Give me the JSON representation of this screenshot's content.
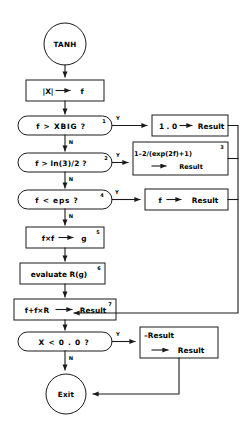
{
  "diagram": {
    "title_node": "TANH",
    "end_node": "Exit",
    "nodes": [
      {
        "id": "start",
        "kind": "terminal",
        "label": "TANH"
      },
      {
        "id": "abs",
        "kind": "process",
        "label": "|X|",
        "arrow": "→",
        "label2": "f"
      },
      {
        "id": "dec_xbig",
        "kind": "decision",
        "label": "f  >  XBIG  ?",
        "note": "1"
      },
      {
        "id": "res_one",
        "kind": "process",
        "label": "1 . 0",
        "arrow": "→",
        "label2": "Result"
      },
      {
        "id": "dec_ln32",
        "kind": "decision",
        "label": "f  >  ln(3)/2  ?",
        "note": "2"
      },
      {
        "id": "res_exp",
        "kind": "process",
        "label": "1–2/(exp(2f)+1)",
        "arrow": "→",
        "label2": "Result",
        "note": "3"
      },
      {
        "id": "dec_eps",
        "kind": "decision",
        "label": "f  <  eps  ?",
        "note": "4"
      },
      {
        "id": "res_f",
        "kind": "process",
        "label": "f",
        "arrow": "→",
        "label2": "Result"
      },
      {
        "id": "sq",
        "kind": "process",
        "label": "f×f",
        "arrow": "→",
        "label2": "g",
        "note": "5"
      },
      {
        "id": "evalr",
        "kind": "process",
        "label": "evaluate  R(g)",
        "note": "6"
      },
      {
        "id": "combine",
        "kind": "process",
        "label": "f+f×R",
        "arrow": "→",
        "label2": "Result",
        "note": "7"
      },
      {
        "id": "dec_neg",
        "kind": "decision",
        "label": "X  <  0 . 0  ?"
      },
      {
        "id": "negate",
        "kind": "process",
        "label": "–Result",
        "arrow": "→",
        "label2": "Result"
      },
      {
        "id": "exit",
        "kind": "terminal",
        "label": "Exit"
      }
    ],
    "branch_labels": {
      "yes": "Y",
      "no": "N"
    },
    "superscripts": [
      "1",
      "2",
      "3",
      "4",
      "5",
      "6",
      "7"
    ],
    "colors": {
      "line": "#1a1a1a",
      "fill": "#ffffff",
      "background": "#ffffff"
    }
  }
}
